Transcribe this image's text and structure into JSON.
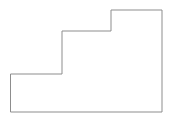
{
  "figure": {
    "name": "stepped-polygon",
    "background_color": "#ffffff",
    "stroke_color": "#8d8d8d",
    "fill_color": "#ffffff",
    "stroke_width": 1,
    "canvas": {
      "width": 171,
      "height": 120
    }
  },
  "chart_data": {
    "type": "line",
    "title": "",
    "subtitle": "",
    "xlabel": "",
    "ylabel": "",
    "xlim": [
      0,
      171
    ],
    "ylim": [
      0,
      120
    ],
    "grid": false,
    "legend": null,
    "tick_labels": {
      "x": [],
      "y": []
    },
    "annotations": [],
    "series": [
      {
        "name": "stepped-polygon-outline",
        "closed": true,
        "stroke": "#8d8d8d",
        "fill": "#ffffff",
        "points": [
          [
            11,
            74
          ],
          [
            62,
            74
          ],
          [
            62,
            31
          ],
          [
            111,
            31
          ],
          [
            111,
            10
          ],
          [
            162,
            10
          ],
          [
            162,
            112
          ],
          [
            11,
            112
          ]
        ],
        "svg_points": "11,74 62,74 62,31 111,31 111,10 162,10 162,112 11,112"
      }
    ]
  }
}
